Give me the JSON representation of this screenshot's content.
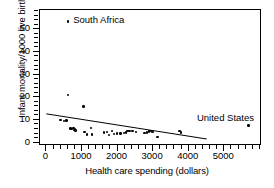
{
  "chart_data": {
    "type": "scatter",
    "title": "",
    "xlabel": "Health care spending (dollars)",
    "ylabel": "Infant mortality/1000 live births",
    "xlim": [
      -180,
      6060
    ],
    "ylim": [
      -1.5,
      58.5
    ],
    "xticks": [
      0,
      1000,
      2000,
      3000,
      4000,
      5000
    ],
    "xticklabels": [
      "0",
      "1000",
      "2000",
      "3000",
      "4000",
      "5000"
    ],
    "yticks": [
      0,
      10,
      20,
      30,
      40,
      50
    ],
    "yticklabels": [
      "0",
      "10",
      "20",
      "30",
      "40",
      "50"
    ],
    "xminor_step": 200,
    "yminor_step": 2,
    "grid": false,
    "legend": null,
    "points": [
      {
        "x": 400,
        "y": 10.0
      },
      {
        "x": 500,
        "y": 9.5
      },
      {
        "x": 560,
        "y": 9.7
      },
      {
        "x": 600,
        "y": 53.5
      },
      {
        "x": 610,
        "y": 21.0
      },
      {
        "x": 680,
        "y": 6.2
      },
      {
        "x": 720,
        "y": 5.9
      },
      {
        "x": 760,
        "y": 6.4
      },
      {
        "x": 790,
        "y": 5.6
      },
      {
        "x": 800,
        "y": 6.1
      },
      {
        "x": 820,
        "y": 5.3
      },
      {
        "x": 1040,
        "y": 16.0
      },
      {
        "x": 1070,
        "y": 4.6
      },
      {
        "x": 1140,
        "y": 3.6
      },
      {
        "x": 1250,
        "y": 6.4
      },
      {
        "x": 1280,
        "y": 3.5
      },
      {
        "x": 1620,
        "y": 4.4
      },
      {
        "x": 1700,
        "y": 4.8
      },
      {
        "x": 1760,
        "y": 3.3
      },
      {
        "x": 1840,
        "y": 5.2
      },
      {
        "x": 1900,
        "y": 3.7
      },
      {
        "x": 1980,
        "y": 4.0
      },
      {
        "x": 2080,
        "y": 4.1
      },
      {
        "x": 2180,
        "y": 4.3
      },
      {
        "x": 2230,
        "y": 4.4
      },
      {
        "x": 2280,
        "y": 5.0
      },
      {
        "x": 2330,
        "y": 5.1
      },
      {
        "x": 2420,
        "y": 5.2
      },
      {
        "x": 2520,
        "y": 4.6
      },
      {
        "x": 2760,
        "y": 4.3
      },
      {
        "x": 2820,
        "y": 4.4
      },
      {
        "x": 2880,
        "y": 4.9
      },
      {
        "x": 2930,
        "y": 5.0
      },
      {
        "x": 2960,
        "y": 4.6
      },
      {
        "x": 3000,
        "y": 4.8
      },
      {
        "x": 3120,
        "y": 2.6
      },
      {
        "x": 3740,
        "y": 5.1
      },
      {
        "x": 3780,
        "y": 4.5
      },
      {
        "x": 5680,
        "y": 7.5
      }
    ],
    "trendline": {
      "x1": 0,
      "y1": 12.0,
      "x2": 6060,
      "y2": -3.0,
      "visible_from_x": 0,
      "visible_to_x": 4550,
      "color": "#000000"
    },
    "annotations": [
      {
        "name": "south-africa",
        "text": "South Africa",
        "x": 780,
        "y": 53.5
      },
      {
        "name": "united-states",
        "text": "United States",
        "x": 4260,
        "y": 10.6
      }
    ]
  }
}
